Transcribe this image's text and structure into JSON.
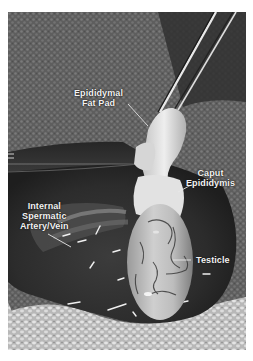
{
  "figure": {
    "type": "grayscale anatomical photograph",
    "colors": {
      "background": "#ffffff",
      "label_text": "#f2f2f2",
      "leader_line": "#e8e8e8",
      "cloth_mid": "#6a6a6a",
      "cavity_dark": "#2a2a2a",
      "tissue_light": "#d8d8d8"
    },
    "labels": [
      {
        "id": "epididymal-fat-pad",
        "line1": "Epididymal",
        "line2": "Fat Pad"
      },
      {
        "id": "caput-epididymis",
        "line1": "Caput",
        "line2": "Epididymis"
      },
      {
        "id": "internal-spermatic",
        "line1": "Internal",
        "line2": "Spermatic",
        "line3": "Artery/Vein"
      },
      {
        "id": "testicle",
        "line1": "Testicle"
      }
    ]
  }
}
